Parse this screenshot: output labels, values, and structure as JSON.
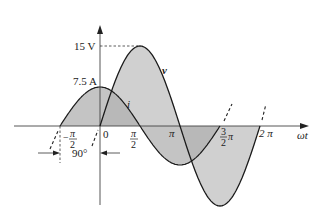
{
  "diagram": {
    "title": "",
    "colors": {
      "background": "#ffffff",
      "axis": "#333333",
      "curve": "#1a1a1a",
      "fill_v": "#c8c8c8",
      "fill_i": "#b4b4b4"
    },
    "axes": {
      "x_label": "ωt",
      "y_labels": {
        "v_peak": "15 V",
        "i_peak": "7.5 A"
      }
    },
    "tick_labels": {
      "neg_half_pi_sign": "−",
      "neg_half_pi_num": "π",
      "neg_half_pi_den": "2",
      "zero": "0",
      "half_pi_num": "π",
      "half_pi_den": "2",
      "pi": "π",
      "three_half_pi_num": "3",
      "three_half_pi_den": "2",
      "three_half_pi_pi": "π",
      "two_pi": "2 π"
    },
    "curves": [
      {
        "name": "v",
        "label": "v",
        "amplitude": "15 V",
        "phase_deg": 0
      },
      {
        "name": "i",
        "label": "i",
        "amplitude": "7.5 A",
        "phase_deg": 90
      }
    ],
    "phase_annotation": "90°"
  }
}
